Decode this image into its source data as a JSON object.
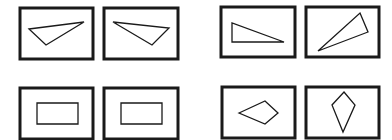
{
  "diagram": {
    "stroke_color": "#1a1a1a",
    "frame_stroke_width": 3,
    "shape_stroke_width": 1.3,
    "pairs": [
      {
        "name": "triangles-mirrored",
        "panels": [
          {
            "frame": {
              "x": 20,
              "y": 8,
              "w": 73,
              "h": 51
            },
            "shape": "triangle",
            "points": "29,29 84,22 46,45"
          },
          {
            "frame": {
              "x": 104,
              "y": 8,
              "w": 74,
              "h": 51
            },
            "shape": "triangle",
            "points": "113,22 169,28 152,45"
          }
        ]
      },
      {
        "name": "triangles-rotated",
        "panels": [
          {
            "frame": {
              "x": 221,
              "y": 7,
              "w": 74,
              "h": 50
            },
            "shape": "right-triangle",
            "points": "232,23 232,42 284,42"
          },
          {
            "frame": {
              "x": 306,
              "y": 7,
              "w": 73,
              "h": 50
            },
            "shape": "triangle",
            "points": "360,13 368,32 318,51"
          }
        ]
      },
      {
        "name": "rectangles-identical",
        "panels": [
          {
            "frame": {
              "x": 20,
              "y": 88,
              "w": 73,
              "h": 51
            },
            "shape": "rectangle",
            "points": "37,103 78,103 78,124 37,124"
          },
          {
            "frame": {
              "x": 104,
              "y": 88,
              "w": 74,
              "h": 51
            },
            "shape": "rectangle",
            "points": "121,103 162,103 162,124 121,124"
          }
        ]
      },
      {
        "name": "kites-rotated",
        "panels": [
          {
            "frame": {
              "x": 222,
              "y": 87,
              "w": 73,
              "h": 51
            },
            "shape": "kite",
            "points": "239,113 265,101 278,113 265,124"
          },
          {
            "frame": {
              "x": 306,
              "y": 87,
              "w": 73,
              "h": 51
            },
            "shape": "kite",
            "points": "344,92 355,105 343,132 332,105"
          }
        ]
      }
    ]
  }
}
